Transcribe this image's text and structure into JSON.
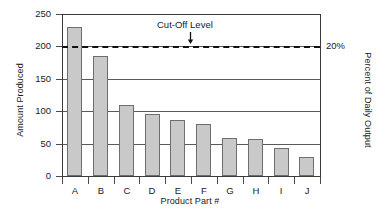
{
  "chart_data": {
    "type": "bar",
    "title": "",
    "xlabel": "Product Part #",
    "ylabel": "Amount Produced",
    "ylabel_right": "Percent of Daily Output",
    "categories": [
      "A",
      "B",
      "C",
      "D",
      "E",
      "F",
      "G",
      "H",
      "I",
      "J"
    ],
    "values": [
      230,
      185,
      110,
      95,
      87,
      80,
      58,
      57,
      43,
      30
    ],
    "ylim": [
      0,
      250
    ],
    "yticks": [
      0,
      50,
      100,
      150,
      200,
      250
    ],
    "ytick_labels": [
      "0",
      "50",
      "100",
      "150",
      "200",
      "250"
    ],
    "right_axis_ticks": [
      200
    ],
    "right_axis_tick_labels": [
      "20%"
    ],
    "grid": true,
    "grid_axis": "y",
    "legend": false,
    "annotations": [
      {
        "text": "Cut-Off Level",
        "y_value": 200,
        "arrow": "down",
        "note": "dashed horizontal cut-off line at 200 units / 20 percent"
      }
    ],
    "series": [
      {
        "name": "Amount Produced",
        "values": [
          230,
          185,
          110,
          95,
          87,
          80,
          58,
          57,
          43,
          30
        ]
      }
    ]
  },
  "style": {
    "bar_fill": "#c9c9c9",
    "bar_stroke": "#6e6e6e",
    "axis_color": "#3a3a3a",
    "grid_color": "#5a5a5a",
    "cutoff_color": "#111111",
    "background": "#ffffff"
  }
}
